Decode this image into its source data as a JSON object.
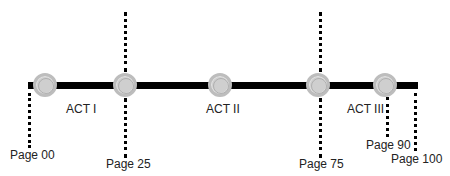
{
  "diagram": {
    "type": "three-act-structure-timeline",
    "acts": [
      {
        "label": "ACT I"
      },
      {
        "label": "ACT II"
      },
      {
        "label": "ACT III"
      }
    ],
    "page_markers": [
      {
        "label": "Page 00"
      },
      {
        "label": "Page 25"
      },
      {
        "label": "Page 75"
      },
      {
        "label": "Page 90"
      },
      {
        "label": "Page 100"
      }
    ],
    "colors": {
      "line": "#000000",
      "node_fill": "#cfcfcf",
      "node_border": "#bdbdbd"
    }
  }
}
